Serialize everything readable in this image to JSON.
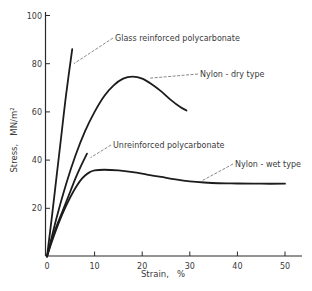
{
  "chart_data": {
    "type": "line",
    "title": "",
    "xlabel": "Strain,   %",
    "ylabel": "Stress,   MN/m²",
    "xlim": [
      0,
      52
    ],
    "ylim": [
      0,
      100
    ],
    "x_ticks": [
      0,
      10,
      20,
      30,
      40,
      50
    ],
    "x_tick_labels": [
      "0",
      "10",
      "20",
      "30",
      "40",
      "50"
    ],
    "y_ticks": [
      20,
      40,
      60,
      80,
      100
    ],
    "y_tick_labels": [
      "20",
      "40",
      "60",
      "80",
      "100"
    ],
    "grid": false,
    "legend": "none (curves labeled by annotations)",
    "series": [
      {
        "name": "Glass reinforced polycarbonate",
        "x": [
          0,
          1,
          2,
          3,
          4,
          5.3
        ],
        "y": [
          0,
          16,
          33,
          50,
          67,
          86
        ]
      },
      {
        "name": "Nylon - dry type",
        "x": [
          0,
          2,
          4,
          6,
          8,
          10,
          12,
          14,
          16,
          18,
          20,
          22,
          24,
          26,
          28,
          29.3
        ],
        "y": [
          0,
          16,
          30,
          42,
          52,
          60,
          66.5,
          71,
          73.8,
          74.6,
          73.8,
          71.5,
          68.5,
          65,
          62,
          60.6
        ]
      },
      {
        "name": "Unreinforced polycarbonate",
        "x": [
          0,
          1,
          2,
          3,
          4,
          5,
          6,
          7,
          8.4
        ],
        "y": [
          0,
          7,
          12.5,
          17.5,
          22.5,
          27.5,
          32.5,
          37,
          42.7
        ]
      },
      {
        "name": "Nylon - wet type",
        "x": [
          0,
          1,
          2,
          3,
          4,
          5,
          6,
          7,
          8,
          9,
          10,
          12,
          15,
          18,
          21,
          24,
          27,
          30,
          33,
          36,
          40,
          45,
          50
        ],
        "y": [
          0,
          6,
          11.5,
          16.5,
          21,
          25,
          28.5,
          31.5,
          33.6,
          35,
          35.7,
          36,
          35.7,
          35,
          34,
          33,
          32,
          31.2,
          30.7,
          30.4,
          30.3,
          30.2,
          30.2
        ]
      }
    ],
    "annotations": [
      {
        "text": "Glass reinforced polycarbonate",
        "points_to": "Glass reinforced polycarbonate",
        "target": [
          5,
          80
        ]
      },
      {
        "text": "Nylon - dry type",
        "points_to": "Nylon - dry type",
        "target": [
          21,
          74
        ]
      },
      {
        "text": "Unreinforced polycarbonate",
        "points_to": "Unreinforced polycarbonate",
        "target": [
          8.5,
          41
        ]
      },
      {
        "text": "Nylon - wet type",
        "points_to": "Nylon - wet type",
        "target": [
          32,
          31.5
        ]
      }
    ]
  }
}
